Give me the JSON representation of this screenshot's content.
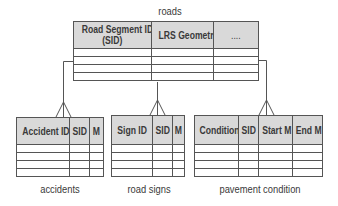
{
  "diagram": {
    "entities": [
      {
        "id": "roads",
        "title": "roads",
        "columns": [
          "Road Segment ID (SID)",
          "LRS Geometry",
          "...."
        ],
        "empty_rows": 4
      },
      {
        "id": "accidents",
        "title": "accidents",
        "columns": [
          "Accident ID",
          "SID",
          "M"
        ],
        "empty_rows": 4
      },
      {
        "id": "road_signs",
        "title": "road signs",
        "columns": [
          "Sign ID",
          "SID",
          "M"
        ],
        "empty_rows": 4
      },
      {
        "id": "pavement_condition",
        "title": "pavement condition",
        "columns": [
          "Condition",
          "SID",
          "Start M",
          "End M"
        ],
        "empty_rows": 4
      }
    ],
    "relationships": [
      {
        "from": "roads",
        "to": "accidents",
        "type": "one-to-many"
      },
      {
        "from": "roads",
        "to": "road_signs",
        "type": "one-to-many"
      },
      {
        "from": "roads",
        "to": "pavement_condition",
        "type": "one-to-many"
      }
    ],
    "labels": {
      "roads_col1_line1": "Road Segment ID",
      "roads_col1_line2": "(SID)"
    }
  }
}
